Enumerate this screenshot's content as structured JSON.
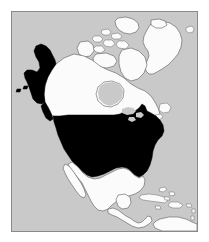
{
  "figure": {
    "kind": "thematic-map",
    "projection_note": "North polar oblique view of North America",
    "frame": {
      "border_color": "#8a8a8a",
      "border_width_px": 1,
      "page_background": "#ffffff"
    },
    "colors": {
      "ocean": "#c9c9c9",
      "land_other": "#fbfbfb",
      "land_highlight": "#000000",
      "coastline": "#5a5a5a"
    }
  },
  "legend": {
    "visible": false,
    "highlight_meaning": "United States of America (contiguous states and Alaska)",
    "base_meaning": "Other land areas"
  },
  "regions": [
    {
      "id": "united-states-contiguous",
      "name": "United States (contiguous)",
      "highlighted": true,
      "fill": "#000000"
    },
    {
      "id": "united-states-alaska",
      "name": "Alaska",
      "highlighted": true,
      "fill": "#000000"
    },
    {
      "id": "canada",
      "name": "Canada",
      "highlighted": false,
      "fill": "#fbfbfb"
    },
    {
      "id": "canadian-arctic-archipelago",
      "name": "Canadian Arctic Archipelago",
      "highlighted": false,
      "fill": "#fbfbfb"
    },
    {
      "id": "greenland",
      "name": "Greenland",
      "highlighted": false,
      "fill": "#fbfbfb"
    },
    {
      "id": "iceland",
      "name": "Iceland",
      "highlighted": false,
      "fill": "#fbfbfb"
    },
    {
      "id": "mexico",
      "name": "Mexico",
      "highlighted": false,
      "fill": "#fbfbfb"
    },
    {
      "id": "baja-california",
      "name": "Baja California",
      "highlighted": false,
      "fill": "#fbfbfb"
    },
    {
      "id": "central-america",
      "name": "Central America",
      "highlighted": false,
      "fill": "#fbfbfb"
    },
    {
      "id": "cuba",
      "name": "Cuba",
      "highlighted": false,
      "fill": "#fbfbfb"
    },
    {
      "id": "hispaniola",
      "name": "Hispaniola",
      "highlighted": false,
      "fill": "#fbfbfb"
    },
    {
      "id": "jamaica",
      "name": "Jamaica",
      "highlighted": false,
      "fill": "#fbfbfb"
    },
    {
      "id": "puerto-rico",
      "name": "Puerto Rico",
      "highlighted": false,
      "fill": "#fbfbfb"
    },
    {
      "id": "bahamas",
      "name": "Bahamas",
      "highlighted": false,
      "fill": "#fbfbfb"
    },
    {
      "id": "newfoundland",
      "name": "Newfoundland",
      "highlighted": false,
      "fill": "#fbfbfb"
    },
    {
      "id": "baffin-island",
      "name": "Baffin Island",
      "highlighted": false,
      "fill": "#fbfbfb"
    },
    {
      "id": "victoria-island",
      "name": "Victoria Island",
      "highlighted": false,
      "fill": "#fbfbfb"
    },
    {
      "id": "ellesmere-island",
      "name": "Ellesmere Island",
      "highlighted": false,
      "fill": "#fbfbfb"
    },
    {
      "id": "banks-island",
      "name": "Banks Island",
      "highlighted": false,
      "fill": "#fbfbfb"
    },
    {
      "id": "hudson-bay",
      "name": "Hudson Bay",
      "highlighted": false,
      "fill": "#c9c9c9"
    },
    {
      "id": "great-lakes",
      "name": "Great Lakes",
      "highlighted": false,
      "fill": "#c9c9c9"
    },
    {
      "id": "aleutian-islands",
      "name": "Aleutian Islands",
      "highlighted": true,
      "fill": "#000000"
    },
    {
      "id": "south-america-north",
      "name": "Northern South America",
      "highlighted": false,
      "fill": "#fbfbfb"
    }
  ]
}
